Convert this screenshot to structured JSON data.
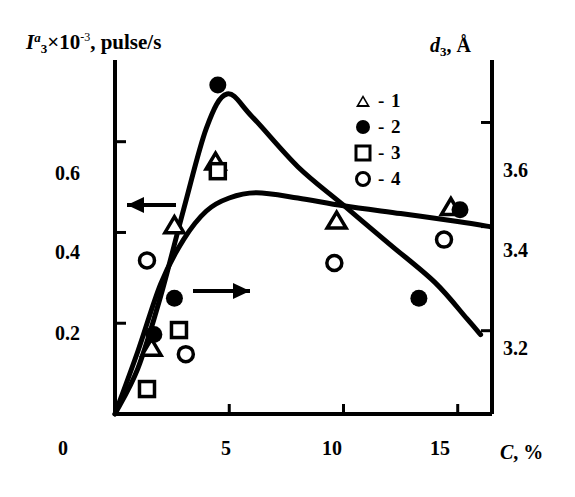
{
  "chart_data": {
    "type": "scatter",
    "title": "",
    "ylabel_left": "I3a x 10-3, pulse/s",
    "ylabel_right": "d3, Å",
    "xlabel": "C, %",
    "xlim": [
      0,
      16.5
    ],
    "ylim_left": [
      0,
      0.78
    ],
    "ylim_right": [
      3.04,
      3.72
    ],
    "xticks": [
      0,
      5,
      10,
      15
    ],
    "xtick_labels": [
      "0",
      "5",
      "10",
      "15"
    ],
    "yticks_left": [
      0.2,
      0.4,
      0.6
    ],
    "ytick_labels_left": [
      "0.2",
      "0.4",
      "0.6"
    ],
    "yticks_right": [
      3.2,
      3.4,
      3.6
    ],
    "ytick_labels_right": [
      "3.2",
      "3.4",
      "3.6"
    ],
    "grid": false,
    "legend_position": "upper-right",
    "legend": [
      {
        "label": "- 1",
        "marker": "open-triangle",
        "name": "series-1"
      },
      {
        "label": "- 2",
        "marker": "filled-circle",
        "name": "series-2"
      },
      {
        "label": "- 3",
        "marker": "open-square",
        "name": "series-3"
      },
      {
        "label": "- 4",
        "marker": "open-circle",
        "name": "series-4"
      }
    ],
    "series": [
      {
        "name": "1",
        "marker": "open-triangle",
        "axis": "left",
        "points": [
          [
            1.6,
            0.145
          ],
          [
            2.6,
            0.415
          ],
          [
            4.4,
            0.555
          ],
          [
            9.7,
            0.425
          ],
          [
            14.7,
            0.455
          ]
        ]
      },
      {
        "name": "2",
        "marker": "filled-circle",
        "axis": "left",
        "points": [
          [
            1.7,
            0.175
          ],
          [
            2.6,
            0.255
          ],
          [
            4.5,
            0.725
          ],
          [
            13.3,
            0.255
          ],
          [
            15.1,
            0.45
          ]
        ]
      },
      {
        "name": "3",
        "marker": "open-square",
        "axis": "left",
        "points": [
          [
            1.4,
            0.055
          ],
          [
            2.8,
            0.185
          ],
          [
            4.5,
            0.535
          ]
        ]
      },
      {
        "name": "4",
        "marker": "open-circle",
        "axis": "right",
        "points": [
          [
            1.4,
            3.335
          ],
          [
            3.1,
            3.155
          ],
          [
            9.6,
            3.33
          ],
          [
            14.4,
            3.375
          ]
        ]
      }
    ],
    "curves": [
      {
        "name": "intensity-curve",
        "axis": "left",
        "arrow": "left",
        "points": [
          [
            0,
            0
          ],
          [
            1.0,
            0.1
          ],
          [
            2.0,
            0.26
          ],
          [
            3.0,
            0.45
          ],
          [
            4.0,
            0.63
          ],
          [
            4.9,
            0.705
          ],
          [
            6.0,
            0.655
          ],
          [
            8.0,
            0.545
          ],
          [
            10.0,
            0.46
          ],
          [
            12.0,
            0.375
          ],
          [
            14.0,
            0.29
          ],
          [
            15.4,
            0.21
          ],
          [
            16.0,
            0.175
          ]
        ]
      },
      {
        "name": "spacing-curve",
        "axis": "right",
        "arrow": "right",
        "points": [
          [
            0,
            3.04
          ],
          [
            1.0,
            3.16
          ],
          [
            2.0,
            3.29
          ],
          [
            3.0,
            3.375
          ],
          [
            4.0,
            3.43
          ],
          [
            5.0,
            3.455
          ],
          [
            6.2,
            3.465
          ],
          [
            8.0,
            3.455
          ],
          [
            10.0,
            3.44
          ],
          [
            12.5,
            3.425
          ],
          [
            15.0,
            3.41
          ],
          [
            16.4,
            3.4
          ]
        ]
      }
    ],
    "arrows": [
      {
        "name": "left-arrow-to-left-axis",
        "direction": "left"
      },
      {
        "name": "right-arrow-to-right-axis",
        "direction": "right"
      }
    ]
  }
}
